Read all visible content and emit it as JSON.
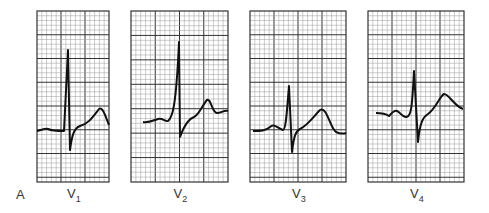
{
  "figure": {
    "panel_letter": "A",
    "colors": {
      "trace": "#111111",
      "minor_grid": "#9a9a9a",
      "major_grid": "#333333",
      "background": "#ffffff"
    },
    "leads": [
      {
        "name": "V",
        "sub": "1",
        "box": [
          37,
          11,
          72,
          171
        ],
        "major_cols": 3,
        "trace": "M37,131 C42,130 45,128 48,129 C52,131 56,131 64,131 L68,50 L70,150 C72,135 74,128 80,126 C88,124 92,118 99,109 C103,106 106,118 109,125"
      },
      {
        "name": "V",
        "sub": "2",
        "box": [
          131,
          11,
          97,
          171
        ],
        "major_cols": 4,
        "trace": "M143,122 C148,123 152,121 158,119 C163,118 165,122 168,121 C172,118 176,110 179,42 L180,137 C184,126 188,119 194,117 C199,115 203,104 207,100 C211,98 212,113 217,113 C221,113 224,110 228,111"
      },
      {
        "name": "V",
        "sub": "3",
        "box": [
          250,
          11,
          96,
          171
        ],
        "major_cols": 4,
        "trace": "M253,131 C260,131 266,131 270,127 C274,123 277,128 283,130 C286,130 287,110 289,86 L292,152 C294,135 296,131 300,129 C308,125 314,116 320,110 C327,106 330,128 336,132 C340,134 343,134 346,133"
      },
      {
        "name": "V",
        "sub": "4",
        "box": [
          368,
          11,
          96,
          171
        ],
        "major_cols": 4,
        "trace": "M376,113 C382,113 386,114 389,116 C392,113 394,110 397,111 C400,112 402,117 406,117 C411,117 412,110 414,71 L418,142 C420,122 423,117 428,114 C436,108 440,96 444,94 C449,94 454,106 463,109"
      }
    ]
  },
  "chart_data": {
    "type": "line",
    "title": "",
    "panel": "A",
    "legend": [
      "V1",
      "V2",
      "V3",
      "V4"
    ],
    "grid": true
  }
}
